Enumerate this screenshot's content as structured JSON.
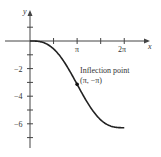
{
  "chart_data": {
    "type": "line",
    "title": "",
    "xlabel": "x",
    "ylabel": "y",
    "function": "y = sin(x) - x",
    "xlim": [
      -1.6,
      7.8
    ],
    "ylim": [
      -7.9,
      2.2
    ],
    "grid": false,
    "x_ticks": [
      {
        "value": 1.5708,
        "label": ""
      },
      {
        "value": 3.1416,
        "label": "π"
      },
      {
        "value": 4.7124,
        "label": ""
      },
      {
        "value": 6.2832,
        "label": "2π"
      }
    ],
    "y_ticks": [
      {
        "value": 1,
        "label": ""
      },
      {
        "value": -1,
        "label": ""
      },
      {
        "value": -2,
        "label": "−2"
      },
      {
        "value": -3,
        "label": ""
      },
      {
        "value": -4,
        "label": "−4"
      },
      {
        "value": -5,
        "label": ""
      },
      {
        "value": -6,
        "label": "−6"
      },
      {
        "value": -7,
        "label": ""
      }
    ],
    "series": [
      {
        "name": "curve",
        "x": [
          0,
          0.5236,
          1.0472,
          1.5708,
          2.0944,
          2.618,
          3.1416,
          3.6652,
          4.1888,
          4.7124,
          5.236,
          5.7596,
          6.2832
        ],
        "y": [
          0,
          -0.0236,
          -0.1812,
          -0.5708,
          -1.2284,
          -2.118,
          -3.1416,
          -4.1652,
          -5.0548,
          -5.7124,
          -6.102,
          -6.2596,
          -6.2832
        ]
      }
    ],
    "annotations": [
      {
        "text": "Inflection point",
        "point": [
          3.1416,
          -3.1416
        ]
      },
      {
        "text": "(π, −π)",
        "point": [
          3.1416,
          -3.1416
        ]
      }
    ]
  },
  "labels": {
    "x_axis": "x",
    "y_axis": "y",
    "annotation_line1": "Inflection point",
    "annotation_line2": "(π, −π)",
    "xtick_pi": "π",
    "xtick_2pi": "2π",
    "ytick_m2": "−2",
    "ytick_m4": "−4",
    "ytick_m6": "−6"
  }
}
